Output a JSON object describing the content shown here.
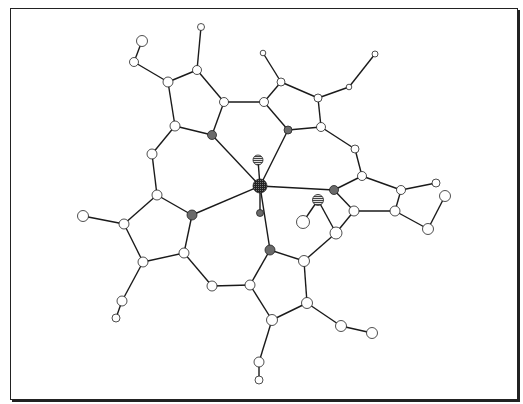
{
  "figure": {
    "type": "molecular-structure",
    "colors": {
      "frame": "#222222",
      "bond": "#1a1a1a",
      "carbon_fill": "#ffffff",
      "nitrogen_fill": "#6a6a6a",
      "metal_fill": "#2a2a2a",
      "ligand_fill": "#9a9a9a"
    },
    "atoms": [
      {
        "id": "M",
        "x": 260,
        "y": 186,
        "r": 7,
        "kind": "metal"
      },
      {
        "id": "Ax1",
        "x": 258,
        "y": 160,
        "r": 5,
        "kind": "ligand"
      },
      {
        "id": "Ax2",
        "x": 260,
        "y": 213,
        "r": 3.5,
        "kind": "nitrogen"
      },
      {
        "id": "N1",
        "x": 212,
        "y": 135,
        "r": 4.5,
        "kind": "nitrogen"
      },
      {
        "id": "N2",
        "x": 288,
        "y": 130,
        "r": 4,
        "kind": "nitrogen"
      },
      {
        "id": "N3",
        "x": 334,
        "y": 190,
        "r": 4.5,
        "kind": "nitrogen"
      },
      {
        "id": "N4",
        "x": 270,
        "y": 250,
        "r": 5,
        "kind": "nitrogen"
      },
      {
        "id": "N5",
        "x": 192,
        "y": 215,
        "r": 5,
        "kind": "nitrogen"
      },
      {
        "id": "L1",
        "x": 318,
        "y": 200,
        "r": 5.5,
        "kind": "ligand"
      },
      {
        "id": "L2",
        "x": 303,
        "y": 222,
        "r": 6.5,
        "kind": "carbon"
      },
      {
        "id": "C1",
        "x": 175,
        "y": 126,
        "r": 5,
        "kind": "carbon"
      },
      {
        "id": "C2",
        "x": 168,
        "y": 82,
        "r": 5,
        "kind": "carbon"
      },
      {
        "id": "C3",
        "x": 197,
        "y": 70,
        "r": 4.5,
        "kind": "carbon"
      },
      {
        "id": "C4",
        "x": 224,
        "y": 102,
        "r": 4.5,
        "kind": "carbon"
      },
      {
        "id": "C5",
        "x": 264,
        "y": 102,
        "r": 4.5,
        "kind": "carbon"
      },
      {
        "id": "C6",
        "x": 281,
        "y": 82,
        "r": 4,
        "kind": "carbon"
      },
      {
        "id": "C7",
        "x": 318,
        "y": 98,
        "r": 4,
        "kind": "carbon"
      },
      {
        "id": "C8",
        "x": 321,
        "y": 127,
        "r": 4.5,
        "kind": "carbon"
      },
      {
        "id": "C9",
        "x": 362,
        "y": 176,
        "r": 4.5,
        "kind": "carbon"
      },
      {
        "id": "C10",
        "x": 401,
        "y": 190,
        "r": 4.5,
        "kind": "carbon"
      },
      {
        "id": "C11",
        "x": 395,
        "y": 211,
        "r": 5,
        "kind": "carbon"
      },
      {
        "id": "C12",
        "x": 354,
        "y": 211,
        "r": 5,
        "kind": "carbon"
      },
      {
        "id": "C13",
        "x": 304,
        "y": 261,
        "r": 5.5,
        "kind": "carbon"
      },
      {
        "id": "C14",
        "x": 307,
        "y": 303,
        "r": 5.5,
        "kind": "carbon"
      },
      {
        "id": "C15",
        "x": 272,
        "y": 320,
        "r": 5.5,
        "kind": "carbon"
      },
      {
        "id": "C16",
        "x": 250,
        "y": 285,
        "r": 5,
        "kind": "carbon"
      },
      {
        "id": "C17",
        "x": 157,
        "y": 195,
        "r": 5,
        "kind": "carbon"
      },
      {
        "id": "C18",
        "x": 124,
        "y": 224,
        "r": 5,
        "kind": "carbon"
      },
      {
        "id": "C19",
        "x": 143,
        "y": 262,
        "r": 5,
        "kind": "carbon"
      },
      {
        "id": "C20",
        "x": 184,
        "y": 253,
        "r": 5,
        "kind": "carbon"
      },
      {
        "id": "B1",
        "x": 152,
        "y": 154,
        "r": 5,
        "kind": "carbon"
      },
      {
        "id": "B2",
        "x": 355,
        "y": 149,
        "r": 4,
        "kind": "carbon"
      },
      {
        "id": "B3",
        "x": 336,
        "y": 233,
        "r": 6,
        "kind": "carbon"
      },
      {
        "id": "B4",
        "x": 212,
        "y": 286,
        "r": 5,
        "kind": "carbon"
      },
      {
        "id": "S1",
        "x": 134,
        "y": 62,
        "r": 4.5,
        "kind": "carbon"
      },
      {
        "id": "S2",
        "x": 142,
        "y": 41,
        "r": 5.5,
        "kind": "carbon"
      },
      {
        "id": "S3",
        "x": 201,
        "y": 27,
        "r": 3.5,
        "kind": "carbon"
      },
      {
        "id": "S4",
        "x": 263,
        "y": 53,
        "r": 2.8,
        "kind": "carbon"
      },
      {
        "id": "S5",
        "x": 349,
        "y": 87,
        "r": 2.8,
        "kind": "carbon"
      },
      {
        "id": "S6",
        "x": 375,
        "y": 54,
        "r": 3,
        "kind": "carbon"
      },
      {
        "id": "S7",
        "x": 436,
        "y": 183,
        "r": 4,
        "kind": "carbon"
      },
      {
        "id": "S8",
        "x": 445,
        "y": 196,
        "r": 5.5,
        "kind": "carbon"
      },
      {
        "id": "S9",
        "x": 428,
        "y": 229,
        "r": 5.5,
        "kind": "carbon"
      },
      {
        "id": "S10",
        "x": 83,
        "y": 216,
        "r": 5.5,
        "kind": "carbon"
      },
      {
        "id": "S11",
        "x": 122,
        "y": 301,
        "r": 5,
        "kind": "carbon"
      },
      {
        "id": "S12",
        "x": 116,
        "y": 318,
        "r": 4,
        "kind": "carbon"
      },
      {
        "id": "S13",
        "x": 341,
        "y": 326,
        "r": 5.5,
        "kind": "carbon"
      },
      {
        "id": "S14",
        "x": 372,
        "y": 333,
        "r": 5.5,
        "kind": "carbon"
      },
      {
        "id": "S15",
        "x": 259,
        "y": 362,
        "r": 5,
        "kind": "carbon"
      },
      {
        "id": "S16",
        "x": 259,
        "y": 380,
        "r": 4,
        "kind": "carbon"
      }
    ],
    "bonds": [
      [
        "M",
        "N1"
      ],
      [
        "M",
        "N2"
      ],
      [
        "M",
        "N3"
      ],
      [
        "M",
        "N4"
      ],
      [
        "M",
        "N5"
      ],
      [
        "M",
        "Ax1"
      ],
      [
        "M",
        "Ax2"
      ],
      [
        "N1",
        "C1"
      ],
      [
        "C1",
        "C2"
      ],
      [
        "C2",
        "C3"
      ],
      [
        "C3",
        "C4"
      ],
      [
        "C4",
        "N1"
      ],
      [
        "C4",
        "C5"
      ],
      [
        "N2",
        "C5"
      ],
      [
        "C5",
        "C6"
      ],
      [
        "C6",
        "C7"
      ],
      [
        "C7",
        "C8"
      ],
      [
        "C8",
        "N2"
      ],
      [
        "C8",
        "B2"
      ],
      [
        "B2",
        "C9"
      ],
      [
        "N3",
        "C9"
      ],
      [
        "C9",
        "C10"
      ],
      [
        "C10",
        "C11"
      ],
      [
        "C11",
        "C12"
      ],
      [
        "C12",
        "N3"
      ],
      [
        "C12",
        "B3"
      ],
      [
        "B3",
        "C13"
      ],
      [
        "N4",
        "C13"
      ],
      [
        "C13",
        "C14"
      ],
      [
        "C14",
        "C15"
      ],
      [
        "C15",
        "C16"
      ],
      [
        "C16",
        "N4"
      ],
      [
        "C16",
        "B4"
      ],
      [
        "B4",
        "C20"
      ],
      [
        "N5",
        "C20"
      ],
      [
        "C20",
        "C19"
      ],
      [
        "C19",
        "C18"
      ],
      [
        "C18",
        "C17"
      ],
      [
        "C17",
        "N5"
      ],
      [
        "C17",
        "B1"
      ],
      [
        "B1",
        "C1"
      ],
      [
        "C2",
        "S1"
      ],
      [
        "S1",
        "S2"
      ],
      [
        "C3",
        "S3"
      ],
      [
        "C6",
        "S4"
      ],
      [
        "C7",
        "S5"
      ],
      [
        "S5",
        "S6"
      ],
      [
        "C10",
        "S7"
      ],
      [
        "C11",
        "S9"
      ],
      [
        "S9",
        "S8"
      ],
      [
        "C18",
        "S10"
      ],
      [
        "C19",
        "S11"
      ],
      [
        "S11",
        "S12"
      ],
      [
        "C14",
        "S13"
      ],
      [
        "S13",
        "S14"
      ],
      [
        "C15",
        "S15"
      ],
      [
        "S15",
        "S16"
      ],
      [
        "L1",
        "L2"
      ],
      [
        "L1",
        "B3"
      ]
    ]
  }
}
